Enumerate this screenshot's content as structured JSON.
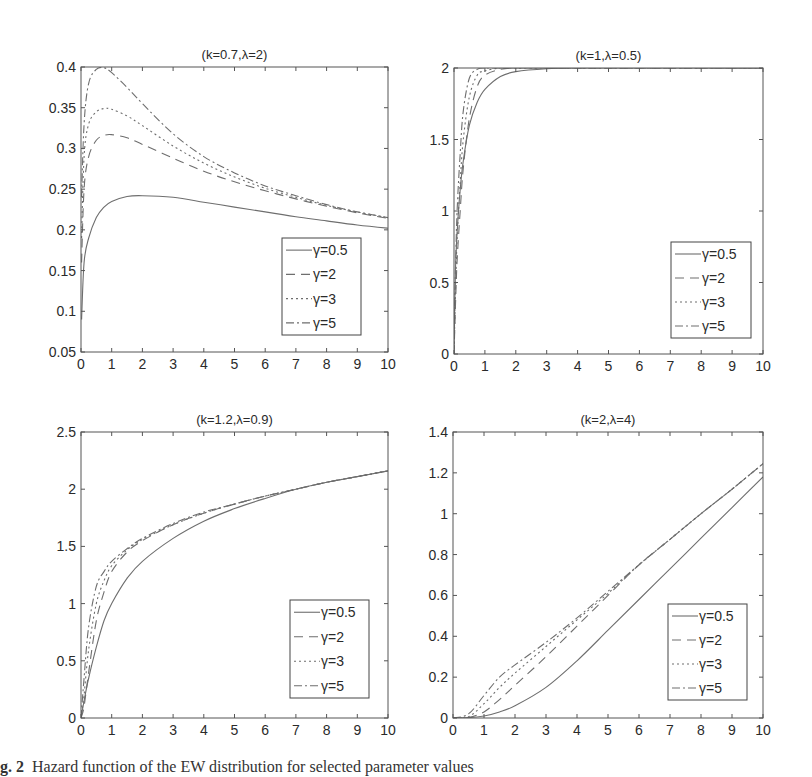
{
  "figure": {
    "caption_label": "g. 2",
    "caption_text": "Hazard function of the EW distribution for selected parameter values"
  },
  "styles": {
    "line_color": "#6e6e6e",
    "axis_color": "#555555",
    "series_dash": [
      "",
      "9,6",
      "2,3",
      "8,3,2,3"
    ]
  },
  "chart_data": [
    {
      "type": "line",
      "title": "(k=0.7,λ=2)",
      "xlabel": "",
      "ylabel": "",
      "xlim": [
        0,
        10
      ],
      "ylim": [
        0.05,
        0.4
      ],
      "xticks": [
        "0",
        "1",
        "2",
        "3",
        "4",
        "5",
        "6",
        "7",
        "8",
        "9",
        "10"
      ],
      "yticks": [
        "0.05",
        "0.1",
        "0.15",
        "0.2",
        "0.25",
        "0.3",
        "0.35",
        "0.4"
      ],
      "ytick_values": [
        0.05,
        0.1,
        0.15,
        0.2,
        0.25,
        0.3,
        0.35,
        0.4
      ],
      "grid": false,
      "legend_position": "lower right",
      "box": {
        "x": 81,
        "y": 67,
        "w": 307,
        "h": 285
      },
      "legend_box": {
        "x": 282,
        "y": 238,
        "w": 79,
        "h": 97
      },
      "x": [
        0.02,
        0.1,
        0.25,
        0.5,
        0.75,
        1,
        1.5,
        2,
        3,
        4,
        5,
        6,
        7,
        8,
        9,
        10
      ],
      "series": [
        {
          "name": "γ=0.5",
          "values": [
            0.09,
            0.16,
            0.19,
            0.215,
            0.228,
            0.235,
            0.241,
            0.242,
            0.24,
            0.234,
            0.228,
            0.222,
            0.216,
            0.211,
            0.206,
            0.202
          ]
        },
        {
          "name": "γ=2",
          "values": [
            0.16,
            0.25,
            0.29,
            0.31,
            0.316,
            0.317,
            0.313,
            0.305,
            0.288,
            0.272,
            0.259,
            0.248,
            0.238,
            0.229,
            0.221,
            0.214
          ]
        },
        {
          "name": "γ=3",
          "values": [
            0.19,
            0.29,
            0.33,
            0.345,
            0.349,
            0.348,
            0.34,
            0.328,
            0.303,
            0.282,
            0.265,
            0.251,
            0.24,
            0.23,
            0.222,
            0.215
          ]
        },
        {
          "name": "γ=5",
          "values": [
            0.24,
            0.33,
            0.38,
            0.397,
            0.399,
            0.393,
            0.375,
            0.355,
            0.318,
            0.29,
            0.27,
            0.254,
            0.242,
            0.231,
            0.222,
            0.215
          ]
        }
      ]
    },
    {
      "type": "line",
      "title": "(k=1,λ=0.5)",
      "xlabel": "",
      "ylabel": "",
      "xlim": [
        0,
        10
      ],
      "ylim": [
        0,
        2
      ],
      "xticks": [
        "0",
        "1",
        "2",
        "3",
        "4",
        "5",
        "6",
        "7",
        "8",
        "9",
        "10"
      ],
      "yticks": [
        "0",
        "0.5",
        "1",
        "1.5",
        "2"
      ],
      "ytick_values": [
        0,
        0.5,
        1,
        1.5,
        2
      ],
      "grid": false,
      "legend_position": "lower right",
      "box": {
        "x": 454,
        "y": 68,
        "w": 309,
        "h": 286
      },
      "legend_box": {
        "x": 671,
        "y": 242,
        "w": 80,
        "h": 96
      },
      "x": [
        0,
        0.05,
        0.1,
        0.2,
        0.3,
        0.5,
        0.75,
        1,
        1.5,
        2,
        3,
        4,
        5,
        10
      ],
      "series": [
        {
          "name": "γ=0.5",
          "values": [
            0.05,
            0.6,
            0.85,
            1.15,
            1.35,
            1.6,
            1.76,
            1.85,
            1.94,
            1.975,
            1.995,
            2,
            2,
            2
          ]
        },
        {
          "name": "γ=2",
          "values": [
            0,
            0.35,
            0.65,
            1.0,
            1.3,
            1.65,
            1.87,
            1.95,
            1.99,
            2,
            2,
            2,
            2,
            2
          ]
        },
        {
          "name": "γ=3",
          "values": [
            0,
            0.45,
            0.8,
            1.2,
            1.5,
            1.8,
            1.95,
            1.98,
            2,
            2,
            2,
            2,
            2,
            2
          ]
        },
        {
          "name": "γ=5",
          "values": [
            0,
            0.6,
            1.0,
            1.4,
            1.7,
            1.93,
            1.99,
            2,
            2,
            2,
            2,
            2,
            2,
            2
          ]
        }
      ]
    },
    {
      "type": "line",
      "title": "(k=1.2,λ=0.9)",
      "xlabel": "",
      "ylabel": "",
      "xlim": [
        0,
        10
      ],
      "ylim": [
        0,
        2.5
      ],
      "xticks": [
        "0",
        "1",
        "2",
        "3",
        "4",
        "5",
        "6",
        "7",
        "8",
        "9",
        "10"
      ],
      "yticks": [
        "0",
        "0.5",
        "1",
        "1.5",
        "2",
        "2.5"
      ],
      "ytick_values": [
        0,
        0.5,
        1,
        1.5,
        2,
        2.5
      ],
      "grid": false,
      "legend_position": "lower right",
      "box": {
        "x": 81,
        "y": 432,
        "w": 307,
        "h": 286
      },
      "legend_box": {
        "x": 290,
        "y": 600,
        "w": 79,
        "h": 98
      },
      "x": [
        0,
        0.1,
        0.25,
        0.5,
        0.75,
        1,
        1.5,
        2,
        3,
        4,
        5,
        6,
        7,
        8,
        9,
        10
      ],
      "series": [
        {
          "name": "γ=0.5",
          "values": [
            0,
            0.15,
            0.35,
            0.62,
            0.85,
            1.0,
            1.22,
            1.37,
            1.57,
            1.72,
            1.83,
            1.92,
            2.0,
            2.06,
            2.11,
            2.16
          ]
        },
        {
          "name": "γ=2",
          "values": [
            0,
            0.1,
            0.4,
            0.85,
            1.1,
            1.28,
            1.45,
            1.55,
            1.69,
            1.79,
            1.87,
            1.94,
            2.0,
            2.06,
            2.11,
            2.16
          ]
        },
        {
          "name": "γ=3",
          "values": [
            0,
            0.2,
            0.6,
            1.0,
            1.2,
            1.33,
            1.47,
            1.56,
            1.69,
            1.79,
            1.87,
            1.94,
            2.0,
            2.06,
            2.11,
            2.16
          ]
        },
        {
          "name": "γ=5",
          "values": [
            0,
            0.35,
            0.8,
            1.15,
            1.28,
            1.37,
            1.48,
            1.57,
            1.7,
            1.8,
            1.87,
            1.94,
            2.0,
            2.06,
            2.11,
            2.16
          ]
        }
      ]
    },
    {
      "type": "line",
      "title": "(k=2,λ=4)",
      "xlabel": "",
      "ylabel": "",
      "xlim": [
        0,
        10
      ],
      "ylim": [
        0,
        1.4
      ],
      "xticks": [
        "0",
        "1",
        "2",
        "3",
        "4",
        "5",
        "6",
        "7",
        "8",
        "9",
        "10"
      ],
      "yticks": [
        "0",
        "0.2",
        "0.4",
        "0.6",
        "0.8",
        "1",
        "1.2",
        "1.4"
      ],
      "ytick_values": [
        0,
        0.2,
        0.4,
        0.6,
        0.8,
        1,
        1.2,
        1.4
      ],
      "grid": false,
      "legend_position": "lower right",
      "box": {
        "x": 453,
        "y": 432,
        "w": 310,
        "h": 286
      },
      "legend_box": {
        "x": 668,
        "y": 604,
        "w": 79,
        "h": 96
      },
      "x": [
        0,
        0.5,
        1,
        1.5,
        2,
        3,
        4,
        5,
        6,
        7,
        8,
        9,
        10
      ],
      "series": [
        {
          "name": "γ=0.5",
          "values": [
            0,
            0.002,
            0.01,
            0.03,
            0.06,
            0.15,
            0.28,
            0.43,
            0.58,
            0.73,
            0.88,
            1.03,
            1.18
          ]
        },
        {
          "name": "γ=2",
          "values": [
            0,
            0.002,
            0.03,
            0.09,
            0.16,
            0.3,
            0.45,
            0.6,
            0.75,
            0.875,
            1.0,
            1.12,
            1.245
          ]
        },
        {
          "name": "γ=3",
          "values": [
            0,
            0.006,
            0.07,
            0.15,
            0.22,
            0.35,
            0.48,
            0.61,
            0.75,
            0.875,
            1.0,
            1.12,
            1.245
          ]
        },
        {
          "name": "γ=5",
          "values": [
            0,
            0.02,
            0.11,
            0.2,
            0.26,
            0.37,
            0.49,
            0.62,
            0.75,
            0.875,
            1.0,
            1.12,
            1.245
          ]
        }
      ]
    }
  ]
}
